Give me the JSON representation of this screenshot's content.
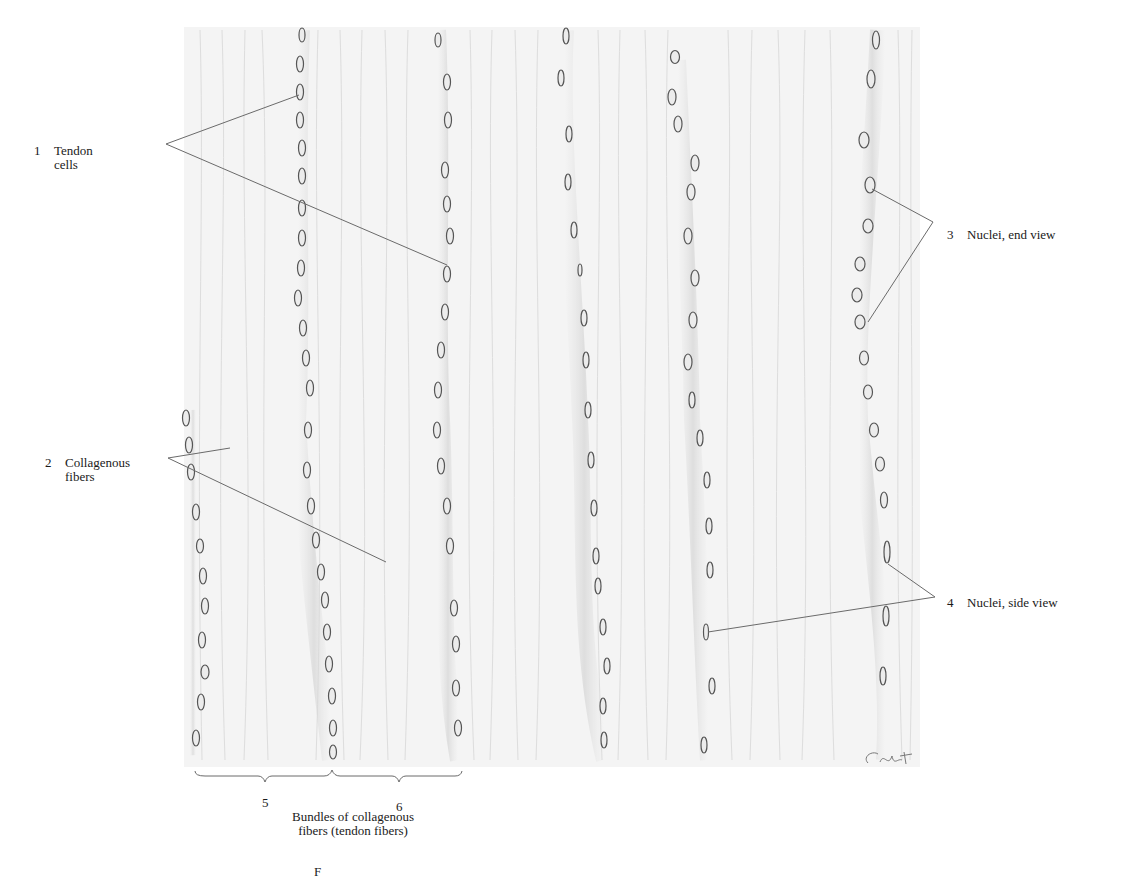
{
  "figure": {
    "colors": {
      "background": "#ffffff",
      "tissue": "#f2f2f2",
      "fiber_streak": "#d9d9d9",
      "cell_row_shade": "#dcdcdc",
      "nucleus_stroke": "#555555",
      "leader_line": "#6a6a6a"
    }
  },
  "labels": {
    "l1": {
      "num": "1",
      "line1": "Tendon",
      "line2": "cells"
    },
    "l2": {
      "num": "2",
      "line1": "Collagenous",
      "line2": "fibers"
    },
    "l3": {
      "num": "3",
      "line1": "Nuclei, end view"
    },
    "l4": {
      "num": "4",
      "line1": "Nuclei, side view"
    }
  },
  "bottom": {
    "num5": "5",
    "num6": "6",
    "caption_line1": "Bundles of collagenous",
    "caption_line2": "fibers (tendon fibers)"
  },
  "caption_fragment": "F",
  "signature": "C.M.L."
}
